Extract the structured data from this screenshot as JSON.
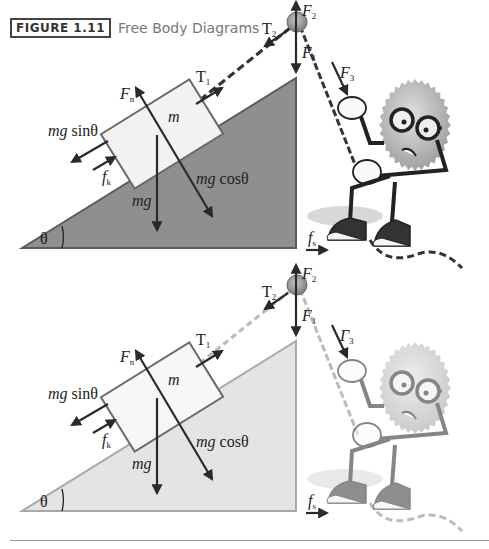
{
  "caption": {
    "figure_label": "FIGURE 1.11",
    "title": "Free Body Diagrams"
  },
  "diagrams": [
    {
      "variant": "dark",
      "colors": {
        "incline": "#8f8f8f",
        "incline_edge": "#5a5a5a",
        "block": "#f2f2f2",
        "arrow": "#2a2a2a",
        "rope": "#333333"
      },
      "labels": {
        "mass": "m",
        "normal": "F",
        "normal_sub": "n",
        "tension1": "T",
        "tension1_sub": "1",
        "tension2": "T",
        "tension2_sub": "2",
        "f1": "F",
        "f1_sub": "1",
        "f2": "F",
        "f2_sub": "2",
        "f3": "F",
        "f3_sub": "3",
        "weight_parallel_pre": "mg",
        "weight_parallel_post": " sinθ",
        "kinetic_friction": "f",
        "kinetic_friction_sub": "k",
        "weight": "mg",
        "weight_perp_pre": "mg",
        "weight_perp_post": " cosθ",
        "angle": "θ",
        "static_friction": "f",
        "static_friction_sub": "s"
      }
    },
    {
      "variant": "light",
      "colors": {
        "incline": "#e4e4e4",
        "incline_edge": "#a8a8a8",
        "block": "#f7f7f7",
        "arrow": "#2a2a2a",
        "rope": "#bbbbbb"
      },
      "labels": {
        "mass": "m",
        "normal": "F",
        "normal_sub": "n",
        "tension1": "T",
        "tension1_sub": "1",
        "tension2": "T",
        "tension2_sub": "2",
        "f1": "F",
        "f1_sub": "1",
        "f2": "F",
        "f2_sub": "2",
        "f3": "Γ",
        "f3_sub": "3",
        "weight_parallel_pre": "mg",
        "weight_parallel_post": " sinθ",
        "kinetic_friction": "f",
        "kinetic_friction_sub": "k",
        "weight": "mg",
        "weight_perp_pre": "mg",
        "weight_perp_post": " cosθ",
        "angle": "θ",
        "static_friction": "f",
        "static_friction_sub": "s"
      }
    }
  ]
}
